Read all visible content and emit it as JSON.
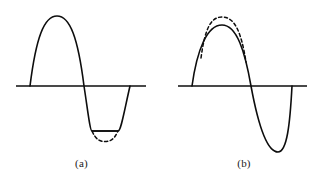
{
  "figure": {
    "background_color": "#ffffff",
    "stroke_color": "#0d0d0d",
    "width": 325,
    "height": 184
  },
  "panels": [
    {
      "id": "a",
      "caption": "(a)",
      "description": "Sine wave with flat-topped clipped negative half-cycle; dashed arc shows undistorted trough",
      "axis": {
        "x1": 16,
        "y": 86,
        "x2": 146
      },
      "zero_crossings": [
        30,
        80,
        130
      ],
      "solid_peak": {
        "x": 57,
        "y": 20
      },
      "solid_trough_clip_level": 131,
      "dashed_trough": {
        "x": 105,
        "y": 141
      },
      "clip_line": {
        "x1": 92,
        "x2": 118,
        "y": 131
      },
      "solid_path": "M 30 86 C 36 38, 44 16, 57 16 C 70 16, 78 38, 84 86 C 88 112, 90 131, 92 131 L 118 131 C 121 131, 124 112, 130 86",
      "dashed_path": "M 92 131 C 96 140, 100 141.5, 105 141.5 C 110 141.5, 114 140, 118 131"
    },
    {
      "id": "b",
      "caption": "(b)",
      "description": "Sine wave with compressed (flattened) positive peak; dashed arc above shows undistorted larger peak",
      "axis": {
        "x1": 15,
        "y": 86,
        "x2": 144
      },
      "zero_crossings": [
        29,
        79,
        129
      ],
      "solid_peak": {
        "x": 59,
        "y": 25
      },
      "dashed_peak": {
        "x": 59,
        "y": 17
      },
      "solid_trough": {
        "x": 115,
        "y": 152
      },
      "solid_path": "M 29 86 C 34 50, 44 25, 59 25 C 74 25, 82 52, 88 86 C 95 124, 104 152, 115 152 C 124 152, 127 124, 129 86",
      "dashed_path": "M 38 58 C 42 28, 48 17, 59 17 C 71 17, 78 30, 83 62",
      "dashed_overlap_note": "dashed arc lies above the solid peak between the rising and falling edges"
    }
  ]
}
